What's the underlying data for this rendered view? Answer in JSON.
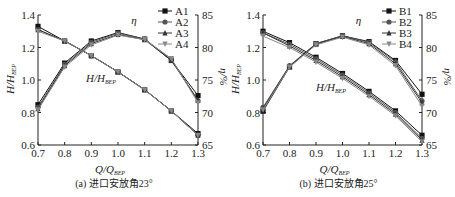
{
  "chart_data": [
    {
      "type": "line",
      "panel": "a",
      "caption": "(a) 进口安放角23°",
      "xlabel": "Q/Q_BEP",
      "ylabel_left": "H/H_BEP",
      "ylabel_right": "η/%",
      "xlim": [
        0.7,
        1.3
      ],
      "ylim_left": [
        0.6,
        1.4
      ],
      "ylim_right": [
        65,
        85
      ],
      "x": [
        0.7,
        0.8,
        0.9,
        1.0,
        1.1,
        1.2,
        1.3
      ],
      "x_ticks": [
        "0.7",
        "0.8",
        "0.9",
        "1.0",
        "1.1",
        "1.2",
        "1.3"
      ],
      "y_ticks_left": [
        "0.6",
        "0.8",
        "1.0",
        "1.2",
        "1.4"
      ],
      "y_ticks_right": [
        "65",
        "70",
        "75",
        "80",
        "85"
      ],
      "annotations": [
        "η",
        "H/H_BEP"
      ],
      "legend_position": "top-right",
      "series": [
        {
          "name": "A1",
          "marker": "square",
          "head": [
            1.33,
            1.24,
            1.15,
            1.05,
            0.94,
            0.81,
            0.67
          ],
          "eta": [
            71.2,
            77.6,
            81.0,
            82.3,
            81.3,
            78.0,
            72.6
          ]
        },
        {
          "name": "A2",
          "marker": "circle",
          "head": [
            1.31,
            1.24,
            1.15,
            1.05,
            0.94,
            0.81,
            0.66
          ],
          "eta": [
            70.8,
            77.4,
            80.8,
            82.2,
            81.3,
            78.2,
            71.8
          ]
        },
        {
          "name": "A3",
          "marker": "triangle-up",
          "head": [
            1.31,
            1.24,
            1.15,
            1.05,
            0.94,
            0.81,
            0.66
          ],
          "eta": [
            70.6,
            77.2,
            80.6,
            82.0,
            81.2,
            78.0,
            71.9
          ]
        },
        {
          "name": "A4",
          "marker": "triangle-down",
          "head": [
            1.3,
            1.24,
            1.15,
            1.05,
            0.94,
            0.81,
            0.66
          ],
          "eta": [
            70.4,
            77.0,
            80.4,
            81.9,
            81.2,
            78.3,
            71.5
          ]
        }
      ]
    },
    {
      "type": "line",
      "panel": "b",
      "caption": "(b) 进口安放角25°",
      "xlabel": "Q/Q_BEP",
      "ylabel_left": "H/H_BEP",
      "ylabel_right": "η/%",
      "xlim": [
        0.7,
        1.3
      ],
      "ylim_left": [
        0.6,
        1.4
      ],
      "ylim_right": [
        65,
        85
      ],
      "x": [
        0.7,
        0.8,
        0.9,
        1.0,
        1.1,
        1.2,
        1.3
      ],
      "x_ticks": [
        "0.7",
        "0.8",
        "0.9",
        "1.0",
        "1.1",
        "1.2",
        "1.3"
      ],
      "y_ticks_left": [
        "0.6",
        "0.8",
        "1.0",
        "1.2",
        "1.4"
      ],
      "y_ticks_right": [
        "65",
        "70",
        "75",
        "80",
        "85"
      ],
      "annotations": [
        "η",
        "H/H_BEP"
      ],
      "legend_position": "top-right",
      "series": [
        {
          "name": "B1",
          "marker": "square",
          "head": [
            1.3,
            1.23,
            1.14,
            1.04,
            0.93,
            0.81,
            0.66
          ],
          "eta": [
            70.2,
            77.0,
            80.6,
            81.8,
            80.9,
            78.0,
            72.8
          ]
        },
        {
          "name": "B2",
          "marker": "circle",
          "head": [
            1.29,
            1.22,
            1.13,
            1.03,
            0.92,
            0.8,
            0.64
          ],
          "eta": [
            70.8,
            77.2,
            80.6,
            81.8,
            80.8,
            77.8,
            71.8
          ]
        },
        {
          "name": "B3",
          "marker": "triangle-up",
          "head": [
            1.29,
            1.21,
            1.12,
            1.02,
            0.91,
            0.79,
            0.63
          ],
          "eta": [
            70.6,
            77.1,
            80.5,
            81.7,
            80.6,
            77.5,
            71.5
          ]
        },
        {
          "name": "B4",
          "marker": "triangle-down",
          "head": [
            1.27,
            1.2,
            1.11,
            1.01,
            0.9,
            0.78,
            0.62
          ],
          "eta": [
            70.4,
            77.0,
            80.4,
            81.6,
            80.4,
            77.2,
            71.0
          ]
        }
      ]
    }
  ],
  "panels": [
    {
      "caption": "(a) 进口安放角23°",
      "legend": [
        "A1",
        "A2",
        "A3",
        "A4"
      ]
    },
    {
      "caption": "(b) 进口安放角25°",
      "legend": [
        "B1",
        "B2",
        "B3",
        "B4"
      ]
    }
  ],
  "labels": {
    "eta_symbol": "η",
    "head_label": "H/H",
    "head_sub": "BEP",
    "x_label": "Q/Q",
    "x_sub": "BEP",
    "y_left": "H/H",
    "y_left_sub": "BEP",
    "y_right": "η/%"
  }
}
